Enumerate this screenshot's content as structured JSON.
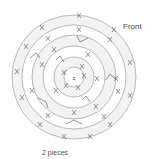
{
  "diagram": {
    "type": "crochet-round-chart",
    "center_label": "c",
    "front_label": "Front",
    "caption": "2 pieces",
    "rounds": 6,
    "round_markers": [
      "1",
      "2",
      "3",
      "4",
      "5"
    ],
    "colors": {
      "line": "#999999",
      "text": "#444444",
      "ring_fill": "#f2f2f2"
    }
  }
}
